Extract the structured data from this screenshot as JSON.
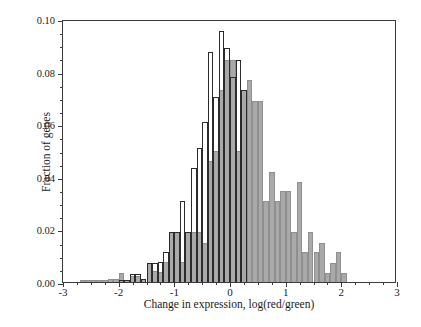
{
  "chart_data": {
    "type": "bar",
    "title": "",
    "subtitle": "",
    "xlabel": "Change in expression, log(red/green)",
    "ylabel": "Fraction of genes",
    "xlim": [
      -3,
      3
    ],
    "ylim": [
      0.0,
      0.1
    ],
    "xticks": [
      -3,
      -2,
      -1,
      0,
      1,
      2,
      3
    ],
    "xtick_labels": [
      "-3",
      "-2",
      "-1",
      "0",
      "1",
      "2",
      "3"
    ],
    "yticks": [
      0.0,
      0.02,
      0.04,
      0.06,
      0.08,
      0.1
    ],
    "ytick_labels": [
      "0.00",
      "0.02",
      "0.04",
      "0.06",
      "0.08",
      "0.10"
    ],
    "xminor_step": 0.25,
    "yminor_step": 0.005,
    "grid": false,
    "legend": "none",
    "bin_width": 0.1,
    "series": [
      {
        "name": "filled",
        "style": "filled-grey",
        "color": "#a9a9a9",
        "edge_color": "#8f8f8f",
        "bin_centers": [
          -2.65,
          -2.55,
          -2.45,
          -2.35,
          -2.25,
          -2.15,
          -2.05,
          -1.95,
          -1.85,
          -1.75,
          -1.65,
          -1.55,
          -1.45,
          -1.35,
          -1.25,
          -1.15,
          -1.05,
          -0.95,
          -0.85,
          -0.75,
          -0.65,
          -0.55,
          -0.45,
          -0.35,
          -0.25,
          -0.15,
          -0.05,
          0.05,
          0.15,
          0.25,
          0.35,
          0.45,
          0.55,
          0.65,
          0.75,
          0.85,
          0.95,
          1.05,
          1.15,
          1.25,
          1.35,
          1.45,
          1.55,
          1.65,
          1.75,
          1.85,
          1.95,
          2.05
        ],
        "values": [
          0.0008,
          0.0008,
          0.0008,
          0.0008,
          0.0008,
          0.0012,
          0.0012,
          0.0035,
          0.0008,
          0.0023,
          0.0023,
          0.0012,
          0.0073,
          0.0042,
          0.0038,
          0.0077,
          0.0192,
          0.0192,
          0.0077,
          0.0192,
          0.0192,
          0.0192,
          0.015,
          0.0462,
          0.05,
          0.073,
          0.0845,
          0.0845,
          0.05,
          0.073,
          0.0768,
          0.069,
          0.069,
          0.0308,
          0.042,
          0.0308,
          0.0345,
          0.0345,
          0.0192,
          0.038,
          0.0115,
          0.0192,
          0.0115,
          0.015,
          0.0035,
          0.0073,
          0.0115,
          0.0035
        ]
      },
      {
        "name": "outline",
        "style": "open-outline",
        "color": "transparent",
        "edge_color": "#2b2b2b",
        "bin_centers": [
          -1.95,
          -1.85,
          -1.75,
          -1.65,
          -1.55,
          -1.45,
          -1.35,
          -1.25,
          -1.15,
          -1.05,
          -0.95,
          -0.85,
          -0.75,
          -0.65,
          -0.55,
          -0.45,
          -0.35,
          -0.25,
          -0.15,
          -0.05,
          0.05,
          0.15,
          0.25
        ],
        "values": [
          0.0008,
          0.0008,
          0.003,
          0.003,
          0.0012,
          0.0073,
          0.0073,
          0.0077,
          0.0115,
          0.0192,
          0.0192,
          0.0308,
          0.0192,
          0.0435,
          0.051,
          0.061,
          0.0875,
          0.0705,
          0.0955,
          0.089,
          0.078,
          0.0845,
          0.073
        ]
      }
    ]
  },
  "figure": {
    "background_color": "#ffffff",
    "axis_color": "#3a3a3a",
    "text_color": "#1a1a1a"
  }
}
